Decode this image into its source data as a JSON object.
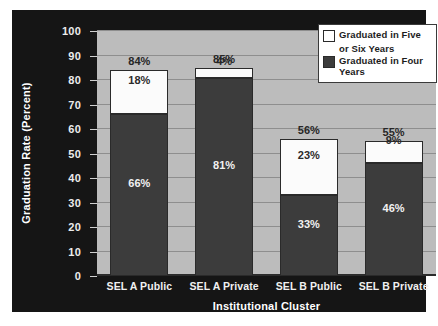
{
  "chart_data": {
    "type": "bar",
    "subtype": "stacked-bar",
    "title": "",
    "xlabel": "Institutional Cluster",
    "ylabel": "Graduation Rate (Percent)",
    "ylim": [
      0,
      100
    ],
    "ytick_step": 10,
    "grid": true,
    "legend_position": "top-right",
    "categories": [
      "SEL A Public",
      "SEL A Private",
      "SEL B Public",
      "SEL B Private"
    ],
    "series": [
      {
        "name": "Graduated in Four Years",
        "color": "#3c3c3c",
        "values": [
          66,
          81,
          33,
          46
        ],
        "labels": [
          "66%",
          "81%",
          "33%",
          "46%"
        ]
      },
      {
        "name": "Graduated in Five or Six Years",
        "color": "#ffffff",
        "values": [
          18,
          4,
          23,
          9
        ],
        "labels": [
          "18%",
          "4%",
          "23%",
          "9%"
        ]
      }
    ],
    "totals": [
      84,
      85,
      56,
      55
    ],
    "total_labels": [
      "84%",
      "85%",
      "56%",
      "55%"
    ],
    "yticks": [
      {
        "value": 100,
        "label": "100"
      },
      {
        "value": 90,
        "label": "90"
      },
      {
        "value": 80,
        "label": "80"
      },
      {
        "value": 70,
        "label": "70"
      },
      {
        "value": 60,
        "label": "60"
      },
      {
        "value": 50,
        "label": "50"
      },
      {
        "value": 40,
        "label": "40"
      },
      {
        "value": 30,
        "label": "30"
      },
      {
        "value": 20,
        "label": "20"
      },
      {
        "value": 10,
        "label": "10"
      },
      {
        "value": 0,
        "label": "0"
      }
    ]
  },
  "legend": {
    "entries": [
      {
        "label_line1": "Graduated in Five",
        "label_line2": "or Six Years",
        "swatch": "white"
      },
      {
        "label_line1": "Graduated in Four Years",
        "label_line2": "",
        "swatch": "dark"
      }
    ]
  },
  "colors": {
    "panel_background": "#151515",
    "plot_background": "#bcbcbc",
    "gridline": "#8e8e8e",
    "bar_four_years": "#3c3c3c",
    "bar_five_six_years": "#ffffff",
    "axis_text": "#ffffff",
    "label_text_dark": "#262626"
  }
}
